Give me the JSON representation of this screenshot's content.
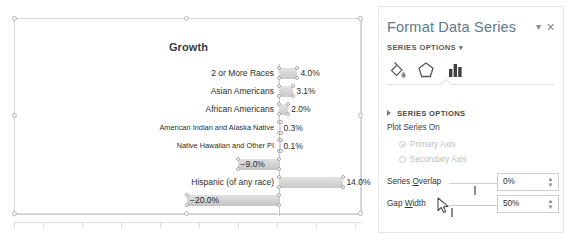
{
  "chart": {
    "title": "Growth",
    "selected": true
  },
  "chart_data": {
    "type": "bar",
    "orientation": "horizontal",
    "title": "Growth",
    "xlabel": "",
    "ylabel": "",
    "grid": false,
    "legend": "none",
    "axis_visible_ticks": false,
    "categories": [
      "2 or More Races",
      "Asian Americans",
      "African Americans",
      "American Indian and Alaska Native",
      "Native Hawaiian and Other PI",
      "White",
      "Hispanic (of any race)",
      "Non-Hispanic"
    ],
    "values": [
      4.0,
      3.1,
      2.0,
      0.3,
      0.1,
      -9.0,
      14.0,
      -20.0
    ],
    "data_labels": [
      "4.0%",
      "3.1%",
      "2.0%",
      "0.3%",
      "0.1%",
      "−9.0%",
      "14.0%",
      "−20.0%"
    ],
    "xlim": [
      -20,
      14
    ],
    "series_color": "#d3d3d3"
  },
  "pane": {
    "title": "Format Data Series",
    "dropdown_icon": "chevron-down-icon",
    "close_icon": "close-icon",
    "subheader": "SERIES OPTIONS",
    "subheader_caret": "▾",
    "tabs": [
      {
        "name": "fill-line-icon",
        "label": "Fill & Line",
        "active": false
      },
      {
        "name": "effects-icon",
        "label": "Effects",
        "active": false
      },
      {
        "name": "series-options-icon",
        "label": "Series Options",
        "active": true
      }
    ],
    "section": {
      "header": "SERIES OPTIONS",
      "expanded": true,
      "plot_series_on_label": "Plot Series On",
      "radios": [
        {
          "label": "Primary Axis",
          "selected": true,
          "disabled": true
        },
        {
          "label": "Secondary Axis",
          "selected": false,
          "disabled": true
        }
      ],
      "controls": [
        {
          "label": "Series Overlap",
          "underline_char": "O",
          "value": "0%",
          "slider_percent": 50
        },
        {
          "label": "Gap Width",
          "underline_char": "W",
          "value": "50%",
          "slider_percent": 5
        }
      ]
    }
  }
}
